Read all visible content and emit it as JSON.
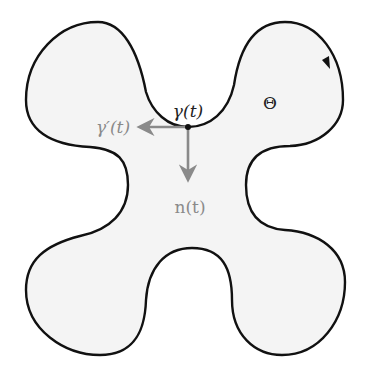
{
  "diagram": {
    "region_label": "Θ",
    "curve_label": "γ(t)",
    "tangent_label": "γ′(t)",
    "normal_label": "n(t)",
    "colors": {
      "fill": "#f4f4f4",
      "curve": "#111111",
      "vector": "#8a8a8a",
      "point": "#111111"
    }
  }
}
